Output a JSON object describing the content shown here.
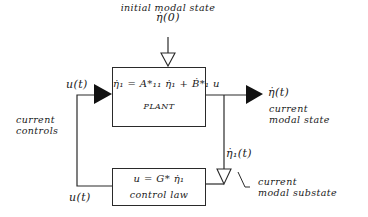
{
  "diagram": {
    "type": "block-diagram",
    "input": {
      "label": "initial modal state",
      "symbol": "η̇(0)"
    },
    "plant": {
      "equation": "η̇₁ = A*₁₁ η̇₁ + Ḃ*₁ u",
      "label": "PLANT"
    },
    "control_law": {
      "equation": "u = G* η̇₁",
      "label": "control law"
    },
    "output": {
      "symbol": "η̇(t)",
      "label_line1": "current",
      "label_line2": "modal state"
    },
    "substate": {
      "symbol": "η̇₁(t)",
      "label_line1": "current",
      "label_line2": "modal substate"
    },
    "controls": {
      "top_symbol": "u(t)",
      "bottom_symbol": "u(t)",
      "label_line1": "current",
      "label_line2": "controls"
    },
    "colors": {
      "line": "#2a2a2a",
      "background": "#ffffff"
    }
  }
}
